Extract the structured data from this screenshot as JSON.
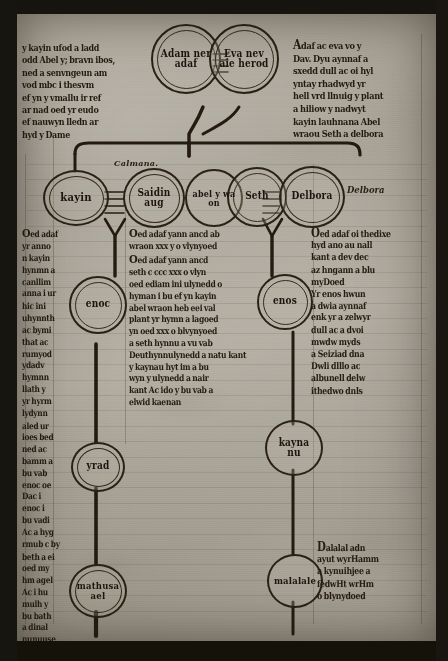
{
  "document": {
    "kind": "medieval-manuscript-folio",
    "script": "gothic-textura",
    "language": "Middle Welsh",
    "subject": "Genealogical diagram of Adam and his descendants",
    "ink_color": "#241c11",
    "parchment_color": "#aaa498",
    "frame_color": "#16140f"
  },
  "medallions": {
    "adam": {
      "label": "Adam ner\nadaf",
      "name": "adam"
    },
    "eve": {
      "label": "Eva nev\naie herod",
      "name": "eve"
    },
    "cain": {
      "label": "kayin",
      "name": "cain"
    },
    "saidin": {
      "label": "Saidin\naug",
      "name": "saidin"
    },
    "abel": {
      "label": "abel y wa\non",
      "name": "abel"
    },
    "seth": {
      "label": "Seth",
      "name": "seth"
    },
    "delbora": {
      "label": "Delbora",
      "name": "delbora"
    },
    "enoc": {
      "label": "enoc",
      "name": "enoc"
    },
    "enos": {
      "label": "enos",
      "name": "enos"
    },
    "yrad": {
      "label": "yrad",
      "name": "yrad"
    },
    "kaynan": {
      "label": "kayna\nnu",
      "name": "kaynan"
    },
    "mathusael": {
      "label": "mathusa\nael",
      "name": "mathusael"
    },
    "malalael": {
      "label": "malalale",
      "name": "malalael"
    }
  },
  "marginalia": {
    "calmana": "Calmana.",
    "delbora": "Delbora"
  },
  "text_blocks": {
    "top_left": [
      "y kayin ufod a ladd",
      "odd Abel y; bravn ibos,",
      "ned a senvngeun am",
      "vod mbc i thesvm",
      "ef yn y vmallu ir ref",
      "ar nad oed yr eudo",
      "ef nauwyn lledn ar",
      "hyd y Dame"
    ],
    "top_right": [
      "Adaf ac eva vo y",
      "Dav. Dyu aynnaf a",
      "sxedd dull ac oi hyl",
      "yntay rhadwyd yr",
      "hell vrd llnuig y plant",
      "a hiliow y nadwyt",
      "kayin lauhnana Abel",
      "wraou Seth a delbora"
    ],
    "left_column": [
      "Oed adaf",
      "yr anno",
      "n kayin",
      "hynmn a",
      "canllim",
      "anna i ur",
      "hic ini",
      "uhynnth",
      "ac bymi",
      "that ac",
      "rumyod",
      "ydadv",
      "hymnn",
      "llath y",
      "yr hyrm",
      "lydynn",
      "aled ur",
      "ioes bed",
      "ned ac",
      "bamm a",
      "bu vab",
      "enoc oe",
      "Dac i",
      "enoc i",
      "bu vadi",
      "Ac a hyg",
      "rmub c by",
      "beth a ei",
      "oed my",
      "hm agel",
      "Ac i hu",
      "mulh y",
      "bu bath",
      "a dinal",
      "nunuuse"
    ],
    "middle_column_upper": [
      "Oed adaf yann ancd ab",
      "wraon xxx y o vlynyoed"
    ],
    "middle_column_main": [
      "Oed adaf yann ancd",
      "seth c ccc xxx o vlyn",
      "oed ediam ini ulynedd o",
      "hyman i bu ef yn kayin",
      "abel wraon heb eei val",
      "plant yr hymn a lagoed",
      "yn oed xxx o blvynyoed",
      "a seth hynnu a vu vab",
      "Deuthynnulynedd a natu kant",
      "y kaynau hyt im a bu",
      "wyn y ulynedd a nair",
      "kant Ac ido y bu vab a",
      "elwid kaenan"
    ],
    "right_column_upper": [
      "Oed adaf oi thedixe",
      "hyd ano au nall",
      "kant a dev dec",
      "az hngann a blu",
      "myDoed",
      "Yr enos hwun",
      "a dwia aynnaf",
      "enk yr a zelwyr",
      "dull ac a dvoi",
      "mwdw myds",
      "a Seiziad dna",
      "Dwli dlllo ac",
      "albunell delw",
      "ithedwo dnls"
    ],
    "right_column_lower": [
      "Dalalal adn",
      "ayut wyrHamm",
      "a kynuihjee a",
      "fedwHt wrHm",
      "o blynydoed"
    ]
  }
}
